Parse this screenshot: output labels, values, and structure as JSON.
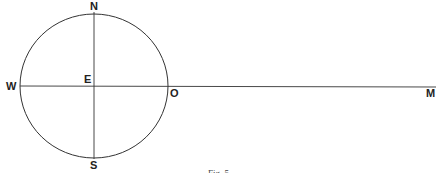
{
  "figure": {
    "labels": {
      "north": "N",
      "south": "S",
      "west": "W",
      "east": "E",
      "point_o": "O",
      "point_m": "M"
    },
    "caption": "Fig. 5",
    "colors": {
      "stroke": "#333333",
      "background": "#ffffff"
    }
  }
}
